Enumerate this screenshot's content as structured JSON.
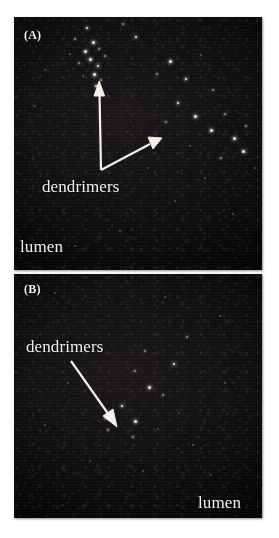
{
  "figure": {
    "type": "fluorescence-micrograph-figure",
    "background_color": "#ffffff",
    "panel_background_color": "#090709",
    "annotation_color": "#f2f0e8",
    "panels": [
      {
        "letter": "(A)",
        "annotation": "dendrimers",
        "region_label": "lumen",
        "arrows": 2
      },
      {
        "letter": "(B)",
        "annotation": "dendrimers",
        "region_label": "lumen",
        "arrows": 1
      }
    ]
  },
  "panelA": {
    "letter": "(A)",
    "annotation": "dendrimers",
    "region_label": "lumen"
  },
  "panelB": {
    "letter": "(B)",
    "annotation": "dendrimers",
    "region_label": "lumen"
  },
  "caption": {
    "text": ""
  }
}
